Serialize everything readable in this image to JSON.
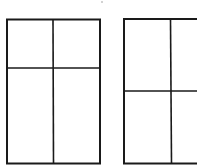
{
  "diagram": {
    "title": "",
    "figures": [
      {
        "name": "left-window",
        "panes": 4,
        "vertical_divider_fraction": 0.5,
        "horizontal_divider_fraction": 0.34
      },
      {
        "name": "right-window",
        "panes": 4,
        "vertical_divider_fraction": 0.5,
        "horizontal_divider_fraction": 0.5,
        "clipped_at_right_edge": true
      }
    ],
    "line_color": "#1a1a1a",
    "background_color": "#ffffff"
  }
}
